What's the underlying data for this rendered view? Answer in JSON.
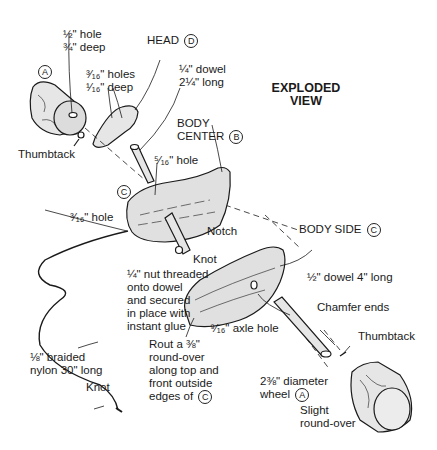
{
  "title": {
    "line1": "EXPLODED",
    "line2": "VIEW"
  },
  "parts": {
    "A": "A",
    "B": "B",
    "C": "C",
    "D": "D"
  },
  "labels": {
    "wheel_hole": {
      "line1": "½\" hole",
      "line2": "¾\" deep"
    },
    "head": {
      "text": "HEAD",
      "ref": "D"
    },
    "head_holes": {
      "line1": "³⁄₁₆\" holes",
      "line2": "¹⁄₁₆\" deep"
    },
    "dowel_quarter": {
      "line1": "¼\" dowel",
      "line2": "2¼\" long"
    },
    "thumbtack_left": "Thumbtack",
    "body_center": {
      "line1": "BODY",
      "line2": "CENTER",
      "ref": "B"
    },
    "hole_5_16": "⁵⁄₁₆\" hole",
    "c_ref_left": "C",
    "hole_3_16": "³⁄₁₆\" hole",
    "notch": "Notch",
    "knot_upper": "Knot",
    "nut_note": {
      "line1": "¼\" nut threaded",
      "line2": "onto dowel",
      "line3": "and secured",
      "line4": "in place with",
      "line5": "instant glue"
    },
    "body_side": {
      "text": "BODY SIDE",
      "ref": "C"
    },
    "dowel_half": "½\" dowel 4\" long",
    "chamfer": "Chamfer ends",
    "axle_hole": "⁹⁄₁₆\" axle hole",
    "thumbtack_right": "Thumbtack",
    "rout": {
      "line1": "Rout a ⅜\"",
      "line2": "round-over",
      "line3": "along top and",
      "line4": "front outside",
      "line5": "edges of",
      "ref": "C"
    },
    "nylon": {
      "line1": "⅛\" braided",
      "line2": "nylon 30\" long"
    },
    "knot_lower": "Knot",
    "wheel": {
      "line1": "2⅜\" diameter",
      "line2": "wheel",
      "ref": "A"
    },
    "slight": {
      "line1": "Slight",
      "line2": "round-over"
    }
  },
  "colors": {
    "line": "#1a1a1a",
    "fill": "#e2e2e2",
    "paper": "#ffffff"
  }
}
